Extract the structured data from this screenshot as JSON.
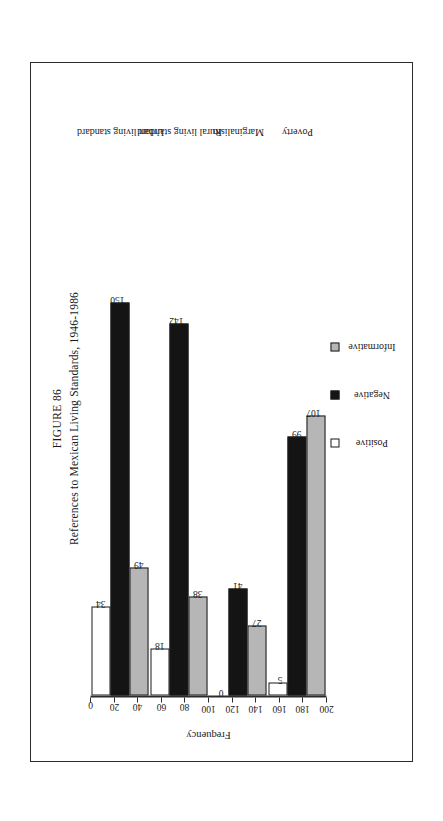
{
  "figure": {
    "label": "FIGURE 86",
    "caption": "References to Mexican Living Standards, 1946-1986"
  },
  "chart_data": {
    "type": "bar",
    "title": "FIGURE 86",
    "subtitle": "References to Mexican Living Standards, 1946-1986",
    "orientation": "vertical",
    "xlabel": "",
    "ylabel": "Frequency",
    "ylim": [
      0,
      200
    ],
    "yticks": [
      0,
      20,
      40,
      60,
      80,
      100,
      120,
      140,
      160,
      180,
      200
    ],
    "grid": false,
    "legend_position": "bottom",
    "categories": [
      "Urban living standard",
      "Rural living standard",
      "Marginalism",
      "Poverty"
    ],
    "series": [
      {
        "name": "Positive",
        "color": "#ffffff",
        "values": [
          34,
          18,
          0,
          5
        ]
      },
      {
        "name": "Negative",
        "color": "#141414",
        "values": [
          150,
          142,
          41,
          99
        ]
      },
      {
        "name": "Informative",
        "color": "#b6b6b6",
        "values": [
          49,
          38,
          27,
          107
        ]
      }
    ]
  }
}
